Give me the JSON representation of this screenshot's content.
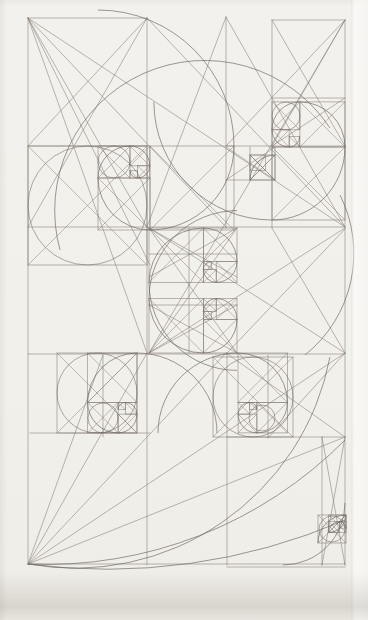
{
  "meta": {
    "kind": "pencil geometric construction study, golden-section rectangles with Fibonacci spirals",
    "canvas": {
      "width": 368,
      "height": 620
    },
    "colors": {
      "paper": "#f2f0eb",
      "line": "#847d75",
      "arc": "#6f6862",
      "frame": "#7a736c"
    },
    "stroke": {
      "line_width": 0.65,
      "arc_width": 0.8,
      "opacity": 0.85
    }
  },
  "drawing": {
    "lines": [
      [
        28,
        18,
        28,
        564
      ],
      [
        345,
        20,
        345,
        565
      ],
      [
        28,
        18,
        147,
        18
      ],
      [
        272,
        20,
        345,
        20
      ],
      [
        28,
        564,
        345,
        564
      ],
      [
        227,
        567,
        345,
        567
      ],
      [
        147,
        18,
        147,
        565
      ],
      [
        226,
        17,
        226,
        228
      ],
      [
        227,
        353,
        227,
        565
      ],
      [
        272,
        20,
        272,
        228
      ],
      [
        268,
        355,
        268,
        438
      ],
      [
        103,
        355,
        103,
        437
      ],
      [
        322,
        437,
        322,
        565
      ],
      [
        189,
        228,
        189,
        353
      ],
      [
        250,
        147,
        250,
        180
      ],
      [
        275,
        147,
        275,
        180
      ],
      [
        28,
        146,
        147,
        146
      ],
      [
        226,
        146,
        345,
        146
      ],
      [
        272,
        98,
        345,
        98
      ],
      [
        28,
        227,
        345,
        227
      ],
      [
        28,
        354,
        345,
        354
      ],
      [
        30,
        433,
        150,
        433
      ],
      [
        227,
        437,
        345,
        437
      ],
      [
        149,
        254,
        237,
        254
      ],
      [
        149,
        305,
        237,
        305
      ],
      [
        226,
        180,
        275,
        180
      ],
      [
        28,
        18,
        345,
        227
      ],
      [
        28,
        18,
        226,
        227
      ],
      [
        28,
        18,
        147,
        227
      ],
      [
        28,
        18,
        150,
        265
      ],
      [
        28,
        18,
        147,
        353
      ],
      [
        147,
        18,
        28,
        146
      ],
      [
        147,
        18,
        28,
        227
      ],
      [
        147,
        18,
        345,
        227
      ],
      [
        226,
        17,
        147,
        227
      ],
      [
        226,
        17,
        345,
        227
      ],
      [
        272,
        20,
        345,
        146
      ],
      [
        345,
        20,
        272,
        146
      ],
      [
        345,
        20,
        149,
        353
      ],
      [
        345,
        20,
        226,
        146
      ],
      [
        272,
        146,
        345,
        98
      ],
      [
        149,
        228,
        237,
        353
      ],
      [
        237,
        228,
        149,
        353
      ],
      [
        149,
        228,
        237,
        277
      ],
      [
        237,
        228,
        149,
        277
      ],
      [
        149,
        305,
        237,
        353
      ],
      [
        149,
        353,
        237,
        305
      ],
      [
        149,
        228,
        345,
        353
      ],
      [
        272,
        228,
        345,
        353
      ],
      [
        345,
        228,
        149,
        353
      ],
      [
        345,
        229,
        227,
        353
      ],
      [
        28,
        564,
        345,
        353
      ],
      [
        28,
        564,
        226,
        353
      ],
      [
        28,
        564,
        147,
        353
      ],
      [
        28,
        564,
        345,
        437
      ],
      [
        28,
        564,
        103,
        355
      ],
      [
        226,
        353,
        345,
        437
      ],
      [
        268,
        438,
        345,
        353
      ],
      [
        322,
        437,
        345,
        565
      ],
      [
        345,
        437,
        322,
        565
      ],
      [
        250,
        155,
        275,
        180
      ],
      [
        275,
        155,
        250,
        180
      ],
      [
        226,
        147,
        275,
        180
      ],
      [
        275,
        147,
        226,
        180
      ]
    ],
    "squares": [
      [
        28,
        146,
        119,
        119
      ],
      [
        57,
        353,
        80,
        80
      ],
      [
        213,
        357,
        80,
        80
      ],
      [
        150,
        146,
        84,
        84
      ],
      [
        98,
        178,
        52,
        52
      ],
      [
        98,
        146,
        32,
        32
      ],
      [
        130,
        146,
        19.8,
        19.8
      ],
      [
        137.6,
        165.8,
        12.2,
        12.2
      ],
      [
        130,
        170.5,
        7.6,
        7.6
      ],
      [
        272,
        147,
        73,
        73
      ],
      [
        299.9,
        101.9,
        45.1,
        45.1
      ],
      [
        272,
        101.9,
        27.9,
        27.9
      ],
      [
        272,
        129.8,
        17.2,
        17.2
      ],
      [
        289.1,
        136.4,
        10.6,
        10.6
      ],
      [
        149,
        228,
        54.4,
        54.4
      ],
      [
        203.4,
        228,
        33.6,
        33.6
      ],
      [
        216.2,
        261.6,
        20.8,
        20.8
      ],
      [
        203.4,
        269.6,
        12.8,
        12.8
      ],
      [
        203.4,
        261.7,
        7.9,
        7.9
      ],
      [
        149,
        298.6,
        54.4,
        54.4
      ],
      [
        203.4,
        319.4,
        33.6,
        33.6
      ],
      [
        216.2,
        298.6,
        20.8,
        20.8
      ],
      [
        203.4,
        298.6,
        12.8,
        12.8
      ],
      [
        203.4,
        311.4,
        7.9,
        7.9
      ],
      [
        87.6,
        353,
        49.4,
        49.4
      ],
      [
        87.6,
        402.4,
        30.5,
        30.5
      ],
      [
        118.1,
        414.1,
        18.8,
        18.8
      ],
      [
        125.3,
        402.5,
        11.6,
        11.6
      ],
      [
        118.1,
        402.5,
        7.2,
        7.2
      ],
      [
        238,
        353,
        49.4,
        49.4
      ],
      [
        256.9,
        402.4,
        30.5,
        30.5
      ],
      [
        238.1,
        414.1,
        18.8,
        18.8
      ],
      [
        238.1,
        402.5,
        11.6,
        11.6
      ],
      [
        249.7,
        402.5,
        7.2,
        7.2
      ],
      [
        318,
        515,
        28,
        28
      ],
      [
        328.7,
        515,
        17.3,
        17.3
      ],
      [
        328.7,
        521.6,
        10.7,
        10.7
      ],
      [
        339.4,
        521.6,
        6.6,
        6.6
      ],
      [
        250,
        155,
        25,
        25
      ],
      [
        250,
        155,
        15.4,
        15.4
      ]
    ],
    "arcs": [
      [
        98,
        10,
        136,
        1,
        234,
        146
      ],
      [
        234,
        146,
        84,
        1,
        150,
        230
      ],
      [
        150,
        230,
        52,
        1,
        98,
        178
      ],
      [
        98,
        178,
        32,
        1,
        130,
        146
      ],
      [
        130,
        146,
        19.8,
        1,
        149.8,
        165.8
      ],
      [
        149.8,
        165.8,
        12.2,
        1,
        137.6,
        178
      ],
      [
        137.6,
        178,
        7.6,
        1,
        130,
        170.5
      ],
      [
        153.9,
        101.9,
        118.1,
        0,
        272,
        220
      ],
      [
        272,
        220,
        73,
        0,
        345,
        147
      ],
      [
        345,
        147,
        45.1,
        0,
        299.9,
        101.9
      ],
      [
        299.9,
        101.9,
        27.9,
        0,
        272,
        129.8
      ],
      [
        272,
        129.8,
        17.2,
        0,
        289.1,
        147
      ],
      [
        289.1,
        147,
        10.6,
        0,
        299.7,
        136.4
      ],
      [
        237,
        370.4,
        88,
        1,
        149,
        282.4
      ],
      [
        149,
        282.4,
        54.4,
        1,
        203.4,
        228
      ],
      [
        203.4,
        228,
        33.6,
        1,
        237,
        261.6
      ],
      [
        237,
        261.6,
        20.8,
        1,
        216.2,
        282.4
      ],
      [
        216.2,
        282.4,
        12.8,
        1,
        203.4,
        269.6
      ],
      [
        203.4,
        269.6,
        7.9,
        1,
        211.3,
        261.7
      ],
      [
        237,
        210.6,
        88,
        0,
        149,
        298.6
      ],
      [
        149,
        298.6,
        54.4,
        0,
        203.4,
        353
      ],
      [
        203.4,
        353,
        33.6,
        0,
        237,
        319.4
      ],
      [
        237,
        319.4,
        20.8,
        0,
        216.2,
        298.6
      ],
      [
        216.2,
        298.6,
        12.8,
        0,
        203.4,
        311.4
      ],
      [
        203.4,
        311.4,
        7.9,
        0,
        211.3,
        319.3
      ],
      [
        217,
        433,
        80,
        0,
        137,
        353
      ],
      [
        137,
        353,
        49.4,
        0,
        87.6,
        402.4
      ],
      [
        87.6,
        402.4,
        30.5,
        0,
        118.1,
        432.9
      ],
      [
        118.1,
        432.9,
        18.8,
        0,
        136.9,
        414.1
      ],
      [
        136.9,
        414.1,
        11.6,
        0,
        125.3,
        402.5
      ],
      [
        125.3,
        402.5,
        7.2,
        0,
        118.1,
        409.7
      ],
      [
        158,
        433,
        80,
        1,
        238,
        353
      ],
      [
        238,
        353,
        49.4,
        1,
        287.4,
        402.4
      ],
      [
        287.4,
        402.4,
        30.5,
        1,
        256.9,
        432.9
      ],
      [
        256.9,
        432.9,
        18.8,
        1,
        238.1,
        414.1
      ],
      [
        238.1,
        414.1,
        11.6,
        1,
        249.7,
        402.5
      ],
      [
        249.7,
        402.5,
        7.2,
        1,
        256.9,
        409.7
      ],
      [
        318,
        543,
        28,
        1,
        346,
        515
      ],
      [
        346,
        515,
        17.3,
        1,
        328.7,
        532.3
      ],
      [
        328.7,
        532.3,
        10.7,
        1,
        339.4,
        521.6
      ],
      [
        339.4,
        521.6,
        6.6,
        1,
        346,
        528.2
      ],
      [
        250,
        180,
        25,
        1,
        275,
        155
      ],
      [
        60,
        250,
        150,
        1,
        330,
        128
      ],
      [
        340,
        195,
        130,
        1,
        305,
        355
      ],
      [
        28,
        564,
        420,
        0,
        345,
        440
      ],
      [
        28,
        564,
        260,
        0,
        330,
        357
      ],
      [
        28,
        564,
        600,
        0,
        345,
        520
      ],
      [
        283,
        565,
        62,
        0,
        345,
        503
      ]
    ],
    "circles": [
      [
        87.5,
        205.5,
        59.5
      ],
      [
        97,
        393,
        40
      ],
      [
        253,
        397,
        40
      ],
      [
        114,
        162,
        16
      ],
      [
        103,
        418,
        15
      ],
      [
        262,
        418,
        13
      ],
      [
        332,
        529,
        13
      ],
      [
        286,
        116,
        14
      ]
    ]
  }
}
